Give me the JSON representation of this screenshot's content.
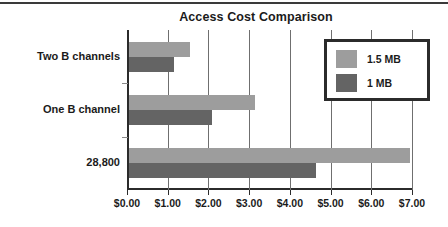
{
  "chart_data": {
    "type": "bar",
    "orientation": "horizontal",
    "title": "Access Cost Comparison",
    "xlabel": "",
    "ylabel": "",
    "categories": [
      "Two B channels",
      "One B channel",
      "28,800"
    ],
    "series": [
      {
        "name": "1.5 MB",
        "color": "#9d9d9d",
        "values": [
          1.5,
          3.1,
          6.9
        ]
      },
      {
        "name": "1 MB",
        "color": "#646464",
        "values": [
          1.1,
          2.05,
          4.6
        ]
      }
    ],
    "xlim": [
      0,
      7
    ],
    "xticks": [
      0,
      1,
      2,
      3,
      4,
      5,
      6,
      7
    ],
    "xtick_labels": [
      "$0.00",
      "$1.00",
      "$2.00",
      "$3.00",
      "$4.00",
      "$5.00",
      "$6.00",
      "$7.00"
    ],
    "grid": true,
    "grid_axis": "x",
    "legend_position": "upper right",
    "legend_entries": [
      "1.5 MB",
      "1 MB"
    ]
  }
}
